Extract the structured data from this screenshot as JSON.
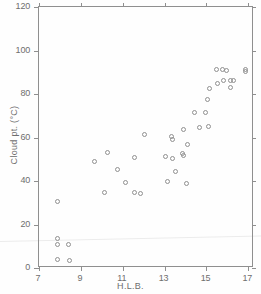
{
  "chart_data": {
    "type": "scatter",
    "title": "",
    "xlabel": "H.L.B.",
    "ylabel": "Cloud pt. (°C)",
    "xlim": [
      7,
      17.27
    ],
    "ylim": [
      0,
      120
    ],
    "xticks": [
      7,
      9,
      11,
      13,
      15,
      17
    ],
    "yticks": [
      0,
      20,
      40,
      60,
      80,
      100,
      120
    ],
    "xtick_labels": [
      "7",
      "9",
      "11",
      "13",
      "15",
      "17"
    ],
    "ytick_labels": [
      "0",
      "20",
      "40",
      "60",
      "80",
      "100",
      "120"
    ],
    "grid": false,
    "legend": null,
    "marker": "open-circle",
    "marker_color": "#909090",
    "series": [
      {
        "name": "Cloud point vs H.L.B.",
        "points": [
          {
            "x": 7.86,
            "y": 30.7
          },
          {
            "x": 7.86,
            "y": 13.7
          },
          {
            "x": 7.86,
            "y": 11.0
          },
          {
            "x": 8.42,
            "y": 10.7
          },
          {
            "x": 7.86,
            "y": 3.9
          },
          {
            "x": 8.48,
            "y": 3.5
          },
          {
            "x": 9.63,
            "y": 49.0
          },
          {
            "x": 10.26,
            "y": 53.0
          },
          {
            "x": 10.75,
            "y": 45.3
          },
          {
            "x": 10.15,
            "y": 34.9
          },
          {
            "x": 11.14,
            "y": 39.3
          },
          {
            "x": 11.54,
            "y": 50.9
          },
          {
            "x": 11.86,
            "y": 34.4
          },
          {
            "x": 11.54,
            "y": 34.9
          },
          {
            "x": 12.03,
            "y": 61.2
          },
          {
            "x": 13.02,
            "y": 51.2
          },
          {
            "x": 13.13,
            "y": 40.0
          },
          {
            "x": 13.34,
            "y": 60.3
          },
          {
            "x": 13.37,
            "y": 59.2
          },
          {
            "x": 13.4,
            "y": 50.5
          },
          {
            "x": 13.52,
            "y": 44.3
          },
          {
            "x": 13.86,
            "y": 52.6
          },
          {
            "x": 13.91,
            "y": 51.7
          },
          {
            "x": 13.91,
            "y": 63.6
          },
          {
            "x": 14.05,
            "y": 38.9
          },
          {
            "x": 14.09,
            "y": 57.0
          },
          {
            "x": 14.43,
            "y": 71.6
          },
          {
            "x": 14.66,
            "y": 64.7
          },
          {
            "x": 14.95,
            "y": 71.6
          },
          {
            "x": 15.05,
            "y": 77.5
          },
          {
            "x": 15.12,
            "y": 65.0
          },
          {
            "x": 15.14,
            "y": 82.5
          },
          {
            "x": 15.49,
            "y": 91.1
          },
          {
            "x": 15.53,
            "y": 84.6
          },
          {
            "x": 15.77,
            "y": 91.1
          },
          {
            "x": 15.82,
            "y": 86.2
          },
          {
            "x": 15.95,
            "y": 90.6
          },
          {
            "x": 16.17,
            "y": 82.8
          },
          {
            "x": 16.17,
            "y": 86.2
          },
          {
            "x": 16.3,
            "y": 86.2
          },
          {
            "x": 16.85,
            "y": 91.1
          },
          {
            "x": 16.87,
            "y": 90.2
          }
        ]
      }
    ]
  },
  "figure": {
    "background_color": "#ffffff",
    "axis_color": "#8f8f8f",
    "text_color": "#6e6e6e"
  }
}
